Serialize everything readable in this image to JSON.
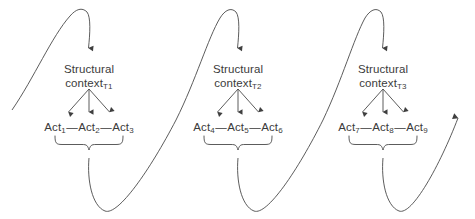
{
  "diagram": {
    "stroke_color": "#4a4a4a",
    "text_color": "#3b3b3b",
    "background_color": "#ffffff",
    "units": [
      {
        "context_line1": "Structural",
        "context_line2": "context",
        "context_subscript": "T1",
        "acts": [
          {
            "label": "Act",
            "subscript": "1"
          },
          {
            "label": "Act",
            "subscript": "2"
          },
          {
            "label": "Act",
            "subscript": "3"
          }
        ],
        "connectors": [
          "—",
          "—"
        ]
      },
      {
        "context_line1": "Structural",
        "context_line2": "context",
        "context_subscript": "T2",
        "acts": [
          {
            "label": "Act",
            "subscript": "4"
          },
          {
            "label": "Act",
            "subscript": "5"
          },
          {
            "label": "Act",
            "subscript": "6"
          }
        ],
        "connectors": [
          "—",
          "—"
        ]
      },
      {
        "context_line1": "Structural",
        "context_line2": "context",
        "context_subscript": "T3",
        "acts": [
          {
            "label": "Act",
            "subscript": "7"
          },
          {
            "label": "Act",
            "subscript": "8"
          },
          {
            "label": "Act",
            "subscript": "9"
          }
        ],
        "connectors": [
          "—",
          "—"
        ]
      }
    ]
  }
}
